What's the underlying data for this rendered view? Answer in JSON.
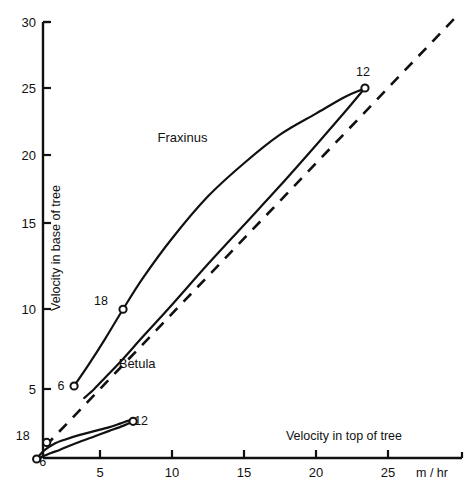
{
  "chart_data": {
    "type": "line",
    "title": "",
    "xlabel": "Velocity in top of tree",
    "ylabel": "Velocity in base of tree",
    "xunits": "m / hr",
    "xlim": [
      0,
      27.5
    ],
    "ylim": [
      0,
      30
    ],
    "xticks": [
      5,
      10,
      15,
      20,
      25
    ],
    "yticks": [
      5,
      10,
      15,
      20,
      25,
      30
    ],
    "xtick_labels": [
      "5",
      "10",
      "15",
      "20",
      "25"
    ],
    "ytick_labels": [
      "5",
      "10",
      "15",
      "20",
      "25",
      "30"
    ],
    "grid": false,
    "legend": "inline-annotations",
    "series": [
      {
        "name": "Fraxinus",
        "label": "Fraxinus",
        "label_x": 9.0,
        "label_y": 21.4,
        "type": "hysteresis-loop",
        "upper_branch_x": [
          3.2,
          4.2,
          5.4,
          6.6,
          8.0,
          10.0,
          12.5,
          15.0,
          17.5,
          20.0,
          22.0,
          23.2,
          23.4
        ],
        "upper_branch_y": [
          5.2,
          6.6,
          8.4,
          10.3,
          12.4,
          15.0,
          17.8,
          20.0,
          21.9,
          23.3,
          24.4,
          24.9,
          25.0
        ],
        "lower_branch_x": [
          23.4,
          22.0,
          20.0,
          17.5,
          15.0,
          12.5,
          10.0,
          8.0,
          6.5,
          5.4,
          4.6,
          3.9
        ],
        "lower_branch_y": [
          25.0,
          23.4,
          21.2,
          18.5,
          15.9,
          13.3,
          10.6,
          8.5,
          6.9,
          5.8,
          5.0,
          4.4
        ],
        "markers": [
          {
            "label": "6",
            "x": 3.2,
            "y": 5.2,
            "label_dx": -13,
            "label_dy": 4
          },
          {
            "label": "18",
            "x": 6.6,
            "y": 10.3,
            "label_dx": -22,
            "label_dy": -4
          },
          {
            "label": "12",
            "x": 23.4,
            "y": 25.0,
            "label_dx": -2,
            "label_dy": -12
          }
        ]
      },
      {
        "name": "Betula",
        "label": "Betula",
        "label_x": 6.3,
        "label_y": 6.4,
        "type": "hysteresis-loop",
        "upper_branch_x": [
          0.6,
          1.1,
          1.8,
          2.6,
          3.6,
          4.6,
          5.6,
          6.4,
          7.0,
          7.3
        ],
        "upper_branch_y": [
          0.35,
          0.9,
          1.35,
          1.65,
          1.95,
          2.2,
          2.45,
          2.7,
          2.9,
          2.85
        ],
        "lower_branch_x": [
          7.3,
          6.6,
          5.6,
          4.6,
          3.6,
          2.8,
          2.2,
          1.6,
          1.1,
          0.6
        ],
        "lower_branch_y": [
          2.85,
          2.55,
          2.2,
          1.85,
          1.5,
          1.2,
          0.95,
          0.75,
          0.55,
          0.35
        ],
        "markers": [
          {
            "label": "6",
            "x": 0.6,
            "y": 0.35,
            "label_dx": 6,
            "label_dy": 7
          },
          {
            "label": "18",
            "x": 1.3,
            "y": 1.45,
            "label_dx": -24,
            "label_dy": -2
          },
          {
            "label": "12",
            "x": 7.3,
            "y": 2.85,
            "label_dx": 8,
            "label_dy": 4
          }
        ]
      },
      {
        "name": "1:1 reference",
        "type": "dashed-diagonal",
        "x": [
          1.2,
          30.0
        ],
        "y": [
          1.2,
          30.0
        ],
        "style": "dashed"
      }
    ],
    "annotations": [
      {
        "text": "Fraxinus",
        "kind": "series-label"
      },
      {
        "text": "Betula",
        "kind": "series-label"
      },
      {
        "text": "m / hr",
        "kind": "axis-units"
      },
      {
        "text": "Velocity in top of tree",
        "kind": "axis-title-x"
      },
      {
        "text": "Velocity in base of tree",
        "kind": "axis-title-y"
      }
    ],
    "marker_note": "Numbers beside open-circle markers denote hour of day (6, 12, 18)"
  }
}
